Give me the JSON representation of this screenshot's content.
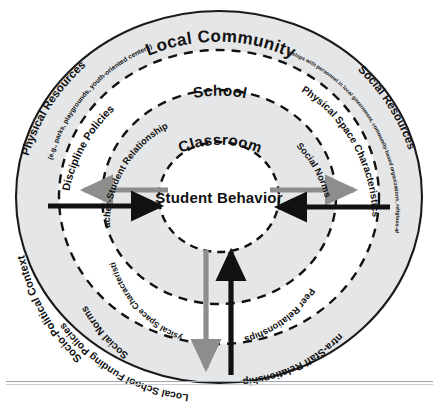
{
  "diagram": {
    "title_center": "Student Behavior",
    "type": "concentric-ecological-systems",
    "colors": {
      "ring_fill_shaded": "#e3e5e7",
      "ring_fill_light": "#ffffff",
      "outline": "#1a1a1a",
      "dashed": "#111111",
      "arrow_inward": "#111111",
      "arrow_outward": "#8d8d8d",
      "text": "#111111",
      "background": "#ffffff"
    },
    "rings": [
      {
        "id": "local-community",
        "label": "Local Community",
        "level": 1,
        "items": [
          {
            "label": "Physical Resources",
            "note": "(e.g., parks, playgrounds, youth-oriented centers)",
            "side": "left"
          },
          {
            "label": "Social Resources",
            "note": "(e.g., relationships with personnel in local government, community-based organizations, religious-affiliated groups)",
            "side": "right"
          },
          {
            "label": "Socio-Political Context",
            "side": "lower-left"
          },
          {
            "label": "Local School Funding Policies",
            "side": "bottom-left"
          }
        ]
      },
      {
        "id": "school",
        "label": "School",
        "level": 2,
        "items": [
          {
            "label": "Discipline Policies",
            "side": "upper-left"
          },
          {
            "label": "Physical Space Characteristics",
            "side": "upper-right"
          },
          {
            "label": "Intra-Staff Relationships",
            "side": "lower-right"
          },
          {
            "label": "Social Norms",
            "side": "lower-left"
          }
        ]
      },
      {
        "id": "classroom",
        "label": "Classroom",
        "level": 3,
        "items": [
          {
            "label": "Teacher-Student Relationships",
            "side": "upper-left"
          },
          {
            "label": "Social Norms",
            "side": "upper-right"
          },
          {
            "label": "Peer Relationships",
            "side": "lower-right"
          },
          {
            "label": "Physical Space Characteristics",
            "side": "lower-left"
          }
        ]
      },
      {
        "id": "student-behavior",
        "label": "Student Behavior",
        "level": 4,
        "items": []
      }
    ],
    "arrows": [
      {
        "id": "left-outward",
        "direction": "outward",
        "color": "#8d8d8d",
        "orientation": "horizontal-left"
      },
      {
        "id": "left-inward",
        "direction": "inward",
        "color": "#111111",
        "orientation": "horizontal-left"
      },
      {
        "id": "right-outward",
        "direction": "outward",
        "color": "#8d8d8d",
        "orientation": "horizontal-right"
      },
      {
        "id": "right-inward",
        "direction": "inward",
        "color": "#111111",
        "orientation": "horizontal-right"
      },
      {
        "id": "bottom-outward",
        "direction": "outward",
        "color": "#8d8d8d",
        "orientation": "vertical-bottom"
      },
      {
        "id": "bottom-inward",
        "direction": "inward",
        "color": "#111111",
        "orientation": "vertical-bottom"
      }
    ]
  }
}
